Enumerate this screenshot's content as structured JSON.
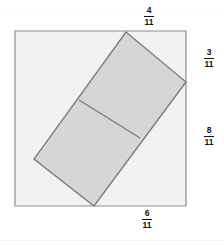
{
  "figure": {
    "kind": "geometry-diagram",
    "colors": {
      "square_fill": "#f2f2f2",
      "square_stroke": "#8c8c8c",
      "rectangle_fill": "#d6d6d6",
      "rectangle_stroke": "#7a7a7a",
      "divider_stroke": "#7a7a7a",
      "label_color": "#111111",
      "background": "#ffffff"
    },
    "square": {
      "top_left": [
        15,
        31
      ],
      "top_right": [
        186,
        31
      ],
      "bottom_right": [
        186,
        206
      ],
      "bottom_left": [
        15,
        206
      ]
    },
    "rectangle": {
      "vertex_top": [
        126,
        32
      ],
      "vertex_right": [
        186,
        82
      ],
      "vertex_bottom": [
        94,
        206
      ],
      "vertex_left": [
        34,
        159
      ]
    },
    "divider": {
      "from": [
        79,
        100
      ],
      "to": [
        140,
        138
      ]
    }
  },
  "labels": {
    "top": {
      "numerator": "4",
      "denominator": "11",
      "position": "top-edge-segment"
    },
    "right_upper": {
      "numerator": "3",
      "denominator": "11",
      "position": "right-edge-upper-segment"
    },
    "right_lower": {
      "numerator": "8",
      "denominator": "11",
      "position": "right-edge-lower-segment"
    },
    "bottom": {
      "numerator": "6",
      "denominator": "11",
      "position": "bottom-edge-segment"
    }
  }
}
